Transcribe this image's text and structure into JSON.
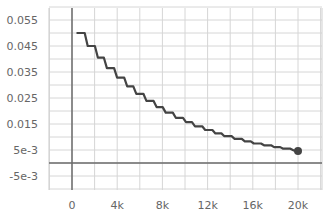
{
  "chart_data": {
    "type": "line",
    "title": "",
    "xlabel": "",
    "ylabel": "",
    "grid": true,
    "legend": "none",
    "xlim": [
      -4400,
      21900
    ],
    "ylim": [
      -0.0098,
      0.0597
    ],
    "x_ticks": [
      {
        "value": 0,
        "label": "0"
      },
      {
        "value": 4000,
        "label": "4k"
      },
      {
        "value": 8000,
        "label": "8k"
      },
      {
        "value": 12000,
        "label": "12k"
      },
      {
        "value": 16000,
        "label": "16k"
      },
      {
        "value": 20000,
        "label": "20k"
      }
    ],
    "y_ticks": [
      {
        "value": 0.055,
        "label": "0.055"
      },
      {
        "value": 0.045,
        "label": "0.045"
      },
      {
        "value": 0.035,
        "label": "0.035"
      },
      {
        "value": 0.025,
        "label": "0.025"
      },
      {
        "value": 0.015,
        "label": "0.015"
      },
      {
        "value": 0.005,
        "label": "5e-3"
      },
      {
        "value": -0.005,
        "label": "-5e-3"
      }
    ],
    "series": [
      {
        "name": "learning_rate",
        "color": "#444444",
        "step": true,
        "x": [
          400,
          1300,
          2200,
          3000,
          3900,
          4800,
          5600,
          6500,
          7400,
          8200,
          9100,
          10000,
          10800,
          11700,
          12600,
          13400,
          14300,
          15200,
          16000,
          16900,
          17800,
          18600,
          19500,
          20000
        ],
        "values": [
          0.05,
          0.045,
          0.0405,
          0.0365,
          0.0328,
          0.0295,
          0.0266,
          0.0239,
          0.0215,
          0.0194,
          0.0174,
          0.0157,
          0.0141,
          0.0127,
          0.0114,
          0.0103,
          0.0093,
          0.0083,
          0.0075,
          0.0068,
          0.0061,
          0.0055,
          0.0049,
          0.0046
        ]
      }
    ],
    "end_marker": {
      "x": 20000,
      "y": 0.0046
    }
  }
}
